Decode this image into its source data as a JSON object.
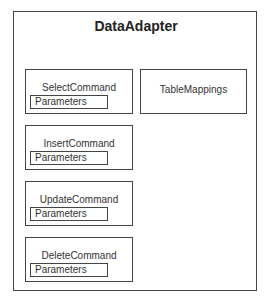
{
  "diagram": {
    "title": "DataAdapter",
    "commands": [
      {
        "label": "SelectCommand",
        "child": "Parameters"
      },
      {
        "label": "InsertCommand",
        "child": "Parameters"
      },
      {
        "label": "UpdateCommand",
        "child": "Parameters"
      },
      {
        "label": "DeleteCommand",
        "child": "Parameters"
      }
    ],
    "table_mappings": {
      "label": "TableMappings"
    }
  }
}
